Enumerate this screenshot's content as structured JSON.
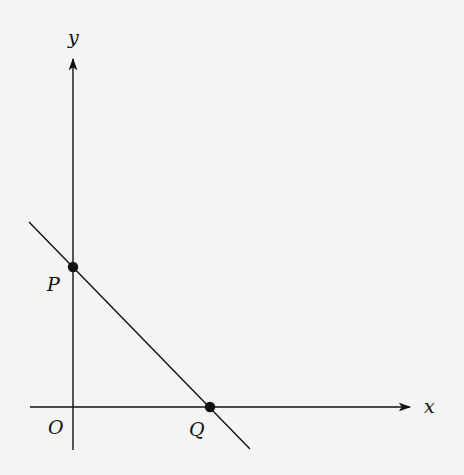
{
  "diagram": {
    "type": "coordinate-plane-line",
    "background_color": "#f4f4f2",
    "stroke_color": "#111111",
    "axes": {
      "x_label": "x",
      "y_label": "y",
      "origin_label": "O"
    },
    "points": [
      {
        "label": "P",
        "location": "y-intercept"
      },
      {
        "label": "Q",
        "location": "x-intercept"
      }
    ],
    "line": {
      "description": "Straight line with negative slope passing through P on the y-axis and Q on the x-axis"
    }
  }
}
